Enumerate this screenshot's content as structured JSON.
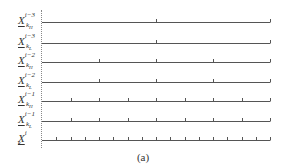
{
  "figure": {
    "caption": "(a)",
    "line_start_x": 42,
    "line_end_x": 270,
    "rows": [
      {
        "base": "X",
        "sub": "k",
        "subsub": "H",
        "sup": "i−3",
        "y": 22,
        "divisions": 2
      },
      {
        "base": "X",
        "sub": "k",
        "subsub": "L",
        "sup": "i−3",
        "y": 43,
        "divisions": 2
      },
      {
        "base": "X",
        "sub": "k",
        "subsub": "H",
        "sup": "i−2",
        "y": 62,
        "divisions": 4
      },
      {
        "base": "X",
        "sub": "k",
        "subsub": "L",
        "sup": "i−2",
        "y": 82,
        "divisions": 4
      },
      {
        "base": "X",
        "sub": "k",
        "subsub": "H",
        "sup": "i−1",
        "y": 101,
        "divisions": 8
      },
      {
        "base": "X",
        "sub": "k",
        "subsub": "L",
        "sup": "i−1",
        "y": 121,
        "divisions": 8
      },
      {
        "base": "X",
        "sub": "k",
        "subsub": "",
        "sup": "i",
        "y": 140,
        "divisions": 16
      }
    ]
  }
}
